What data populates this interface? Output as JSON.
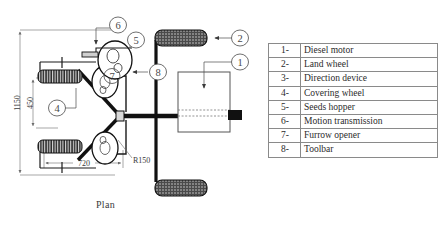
{
  "figure": {
    "caption": "Plan",
    "view_type": "plan view engineering drawing"
  },
  "dimensions": [
    {
      "id": "overall-width",
      "value": "1150",
      "orientation": "vertical"
    },
    {
      "id": "inner-width",
      "value": "450",
      "orientation": "vertical"
    },
    {
      "id": "wheel-track",
      "value": "720",
      "orientation": "horizontal"
    },
    {
      "id": "disc-radius",
      "value": "R150",
      "orientation": "radial"
    }
  ],
  "callouts": [
    {
      "number": "1",
      "target": "Diesel motor"
    },
    {
      "number": "2",
      "target": "Land wheel"
    },
    {
      "number": "4",
      "target": "Covering wheel"
    },
    {
      "number": "5",
      "target": "Seeds hopper"
    },
    {
      "number": "6",
      "target": "Motion transmission"
    },
    {
      "number": "7",
      "target": "Furrow opener"
    },
    {
      "number": "8",
      "target": "Toolbar"
    }
  ],
  "legend": {
    "rows": [
      {
        "num": "1-",
        "label": "Diesel motor"
      },
      {
        "num": "2-",
        "label": "Land wheel"
      },
      {
        "num": "3-",
        "label": "Direction device"
      },
      {
        "num": "4-",
        "label": "Covering wheel"
      },
      {
        "num": "5-",
        "label": "Seeds hopper"
      },
      {
        "num": "6-",
        "label": "Motion transmission"
      },
      {
        "num": "7-",
        "label": "Furrow opener"
      },
      {
        "num": "8-",
        "label": "Toolbar"
      }
    ]
  },
  "colors": {
    "background": "#ffffff",
    "line": "#1a1a1a",
    "dimension_line": "#6b6b6b",
    "table_border": "#8a8a8a",
    "text": "#2b2b2b"
  }
}
